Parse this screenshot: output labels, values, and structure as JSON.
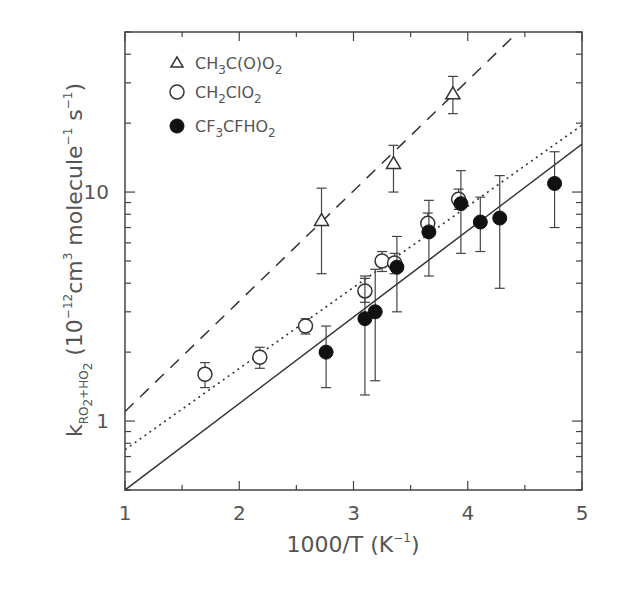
{
  "chart_data": {
    "type": "scatter",
    "title": "",
    "xlabel": "1000/T (K^-1)",
    "ylabel": "k_{RO2+HO2} (10^-12 cm^3 molecule^-1 s^-1)",
    "xlim": [
      1,
      5
    ],
    "ylim": [
      0.5,
      50
    ],
    "yscale": "log",
    "grid": false,
    "legend_position": "upper left",
    "x_ticks": [
      1,
      2,
      3,
      4,
      5
    ],
    "y_ticks": [
      1,
      10
    ],
    "series": [
      {
        "name": "CH3C(O)O2",
        "marker": "open-triangle",
        "points": [
          {
            "x": 2.72,
            "y": 7.5,
            "err_low": 4.4,
            "err_high": 10.4
          },
          {
            "x": 3.35,
            "y": 13.3,
            "err_low": 10.0,
            "err_high": 16.0
          },
          {
            "x": 3.87,
            "y": 26.8,
            "err_low": 22.0,
            "err_high": 32.0
          }
        ],
        "fit_line": {
          "style": "dashed",
          "x": [
            1,
            4.44
          ],
          "y": [
            1.1,
            50
          ]
        }
      },
      {
        "name": "CH2ClO2",
        "marker": "open-circle",
        "points": [
          {
            "x": 1.7,
            "y": 1.6,
            "err_low": 1.4,
            "err_high": 1.8
          },
          {
            "x": 2.18,
            "y": 1.9,
            "err_low": 1.7,
            "err_high": 2.1
          },
          {
            "x": 2.58,
            "y": 2.6,
            "err_low": 2.4,
            "err_high": 2.8
          },
          {
            "x": 3.1,
            "y": 3.7,
            "err_low": 3.3,
            "err_high": 4.2
          },
          {
            "x": 3.25,
            "y": 5.0,
            "err_low": 4.5,
            "err_high": 5.5
          },
          {
            "x": 3.36,
            "y": 4.9,
            "err_low": 4.4,
            "err_high": 5.4
          },
          {
            "x": 3.65,
            "y": 7.3,
            "err_low": 6.6,
            "err_high": 8.1
          },
          {
            "x": 3.92,
            "y": 9.3,
            "err_low": 8.4,
            "err_high": 10.3
          }
        ],
        "fit_line": {
          "style": "dotted",
          "x": [
            1,
            5
          ],
          "y": [
            0.75,
            19.6
          ]
        }
      },
      {
        "name": "CF3CFHO2",
        "marker": "filled-circle",
        "points": [
          {
            "x": 2.76,
            "y": 2.0,
            "err_low": 1.4,
            "err_high": 2.6
          },
          {
            "x": 3.1,
            "y": 2.8,
            "err_low": 1.3,
            "err_high": 4.3
          },
          {
            "x": 3.19,
            "y": 3.0,
            "err_low": 1.5,
            "err_high": 4.6
          },
          {
            "x": 3.38,
            "y": 4.7,
            "err_low": 3.0,
            "err_high": 6.4
          },
          {
            "x": 3.66,
            "y": 6.7,
            "err_low": 4.3,
            "err_high": 9.2
          },
          {
            "x": 3.94,
            "y": 8.9,
            "err_low": 5.4,
            "err_high": 12.4
          },
          {
            "x": 4.11,
            "y": 7.4,
            "err_low": 5.5,
            "err_high": 9.5
          },
          {
            "x": 4.28,
            "y": 7.7,
            "err_low": 3.8,
            "err_high": 11.8
          },
          {
            "x": 4.76,
            "y": 10.9,
            "err_low": 7.0,
            "err_high": 15.0
          }
        ],
        "fit_line": {
          "style": "solid",
          "x": [
            1,
            5
          ],
          "y": [
            0.5,
            16.2
          ]
        }
      }
    ]
  },
  "legend": {
    "items": [
      {
        "marker": "open-triangle",
        "base1": "CH",
        "sub1": "3",
        "base2": "C(O)O",
        "sub2": "2"
      },
      {
        "marker": "open-circle",
        "base1": "CH",
        "sub1": "2",
        "base2": "ClO",
        "sub2": "2"
      },
      {
        "marker": "filled-circle",
        "base1": "CF",
        "sub1": "3",
        "base2": "CFHO",
        "sub2": "2"
      }
    ]
  },
  "axes": {
    "x_tick_labels": [
      "1",
      "2",
      "3",
      "4",
      "5"
    ],
    "y_tick_labels": [
      "1",
      "10"
    ],
    "xlabel": {
      "main": "1000/T (K",
      "sup": "−1",
      "close": ")"
    },
    "ylabel": {
      "k": "k",
      "sub": "RO",
      "sub_sub": "2",
      "sub_rest": "+HO",
      "sub_sub2": "2",
      "paren": " (10",
      "exp1": "−12",
      "cm": "cm",
      "exp2": "3",
      "molecule": " molecule",
      "exp3": "−1",
      "s": " s",
      "exp4": "−1",
      "close": ")"
    }
  },
  "colors": {
    "ink": "#333333",
    "text": "#555555",
    "background": "#ffffff"
  }
}
